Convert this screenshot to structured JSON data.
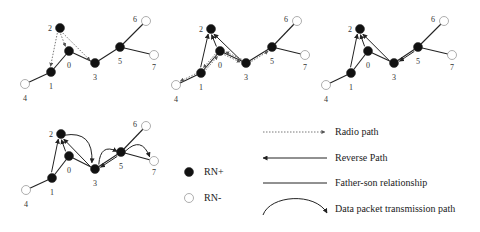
{
  "diagram": {
    "panels": [
      {
        "id": "panel-1",
        "offset": [
          0,
          0
        ],
        "nodes": [
          {
            "id": "0",
            "x": 69,
            "y": 51,
            "type": "RN+",
            "label_pos": [
              69,
              66
            ]
          },
          {
            "id": "1",
            "x": 51,
            "y": 72,
            "type": "RN+",
            "label_pos": [
              51,
              87
            ]
          },
          {
            "id": "2",
            "x": 60,
            "y": 28,
            "type": "RN+",
            "label_pos": [
              50,
              29
            ]
          },
          {
            "id": "3",
            "x": 95,
            "y": 63,
            "type": "RN+",
            "label_pos": [
              95,
              78
            ]
          },
          {
            "id": "4",
            "x": 25,
            "y": 84,
            "type": "RN-",
            "label_pos": [
              25,
              99
            ]
          },
          {
            "id": "5",
            "x": 120,
            "y": 47,
            "type": "RN+",
            "label_pos": [
              120,
              62
            ]
          },
          {
            "id": "6",
            "x": 146,
            "y": 21,
            "type": "RN-",
            "label_pos": [
              135,
              20
            ]
          },
          {
            "id": "7",
            "x": 154,
            "y": 55,
            "type": "RN-",
            "label_pos": [
              154,
              68
            ]
          }
        ],
        "edges": [
          [
            "0",
            "1"
          ],
          [
            "1",
            "4"
          ],
          [
            "0",
            "3"
          ],
          [
            "3",
            "5"
          ],
          [
            "5",
            "6"
          ],
          [
            "5",
            "7"
          ]
        ],
        "radio_paths": [
          [
            "2",
            "1"
          ],
          [
            "2",
            "0"
          ],
          [
            "2",
            "3"
          ]
        ],
        "reverse_paths": [],
        "data_paths": []
      },
      {
        "id": "panel-2",
        "offset": [
          151,
          0
        ],
        "nodes": [
          {
            "id": "0",
            "x": 69,
            "y": 51,
            "type": "RN+",
            "label_pos": [
              69,
              66
            ]
          },
          {
            "id": "1",
            "x": 50,
            "y": 73,
            "type": "RN+",
            "label_pos": [
              50,
              88
            ]
          },
          {
            "id": "2",
            "x": 60,
            "y": 29,
            "type": "RN+",
            "label_pos": [
              50,
              30
            ]
          },
          {
            "id": "3",
            "x": 95,
            "y": 63,
            "type": "RN+",
            "label_pos": [
              95,
              78
            ]
          },
          {
            "id": "4",
            "x": 25,
            "y": 85,
            "type": "RN-",
            "label_pos": [
              25,
              100
            ]
          },
          {
            "id": "5",
            "x": 121,
            "y": 47,
            "type": "RN+",
            "label_pos": [
              121,
              62
            ]
          },
          {
            "id": "6",
            "x": 146,
            "y": 21,
            "type": "RN-",
            "label_pos": [
              135,
              20
            ]
          },
          {
            "id": "7",
            "x": 154,
            "y": 55,
            "type": "RN-",
            "label_pos": [
              154,
              68
            ]
          }
        ],
        "edges": [
          [
            "0",
            "1"
          ],
          [
            "1",
            "4"
          ],
          [
            "0",
            "3"
          ],
          [
            "3",
            "5"
          ],
          [
            "5",
            "6"
          ],
          [
            "5",
            "7"
          ]
        ],
        "radio_paths": [
          [
            "1",
            "4"
          ],
          [
            "0",
            "1"
          ],
          [
            "0",
            "3"
          ],
          [
            "3",
            "0"
          ],
          [
            "3",
            "5"
          ],
          [
            "1",
            "0"
          ]
        ],
        "reverse_paths": [
          [
            "1",
            "2"
          ],
          [
            "0",
            "2"
          ],
          [
            "3",
            "2"
          ]
        ],
        "data_paths": []
      },
      {
        "id": "panel-3",
        "offset": [
          300,
          0
        ],
        "nodes": [
          {
            "id": "0",
            "x": 68,
            "y": 51,
            "type": "RN+",
            "label_pos": [
              68,
              66
            ]
          },
          {
            "id": "1",
            "x": 51,
            "y": 73,
            "type": "RN+",
            "label_pos": [
              51,
              88
            ]
          },
          {
            "id": "2",
            "x": 60,
            "y": 29,
            "type": "RN+",
            "label_pos": [
              50,
              30
            ]
          },
          {
            "id": "3",
            "x": 94,
            "y": 63,
            "type": "RN+",
            "label_pos": [
              94,
              78
            ]
          },
          {
            "id": "4",
            "x": 26,
            "y": 85,
            "type": "RN-",
            "label_pos": [
              26,
              100
            ]
          },
          {
            "id": "5",
            "x": 118,
            "y": 47,
            "type": "RN+",
            "label_pos": [
              118,
              62
            ]
          },
          {
            "id": "6",
            "x": 144,
            "y": 21,
            "type": "RN-",
            "label_pos": [
              133,
              20
            ]
          },
          {
            "id": "7",
            "x": 152,
            "y": 55,
            "type": "RN-",
            "label_pos": [
              152,
              68
            ]
          }
        ],
        "edges": [
          [
            "0",
            "1"
          ],
          [
            "1",
            "4"
          ],
          [
            "0",
            "3"
          ],
          [
            "3",
            "5"
          ],
          [
            "5",
            "6"
          ],
          [
            "5",
            "7"
          ]
        ],
        "radio_paths": [],
        "reverse_paths": [
          [
            "1",
            "2"
          ],
          [
            "0",
            "2"
          ],
          [
            "3",
            "2"
          ],
          [
            "5",
            "3"
          ]
        ],
        "data_paths": []
      },
      {
        "id": "panel-4",
        "offset": [
          0,
          105
        ],
        "nodes": [
          {
            "id": "0",
            "x": 69,
            "y": 51,
            "type": "RN+",
            "label_pos": [
              69,
              66
            ]
          },
          {
            "id": "1",
            "x": 52,
            "y": 73,
            "type": "RN+",
            "label_pos": [
              52,
              88
            ]
          },
          {
            "id": "2",
            "x": 61,
            "y": 29,
            "type": "RN+",
            "label_pos": [
              51,
              30
            ]
          },
          {
            "id": "3",
            "x": 95,
            "y": 64,
            "type": "RN+",
            "label_pos": [
              95,
              79
            ]
          },
          {
            "id": "4",
            "x": 26,
            "y": 85,
            "type": "RN-",
            "label_pos": [
              26,
              100
            ]
          },
          {
            "id": "5",
            "x": 121,
            "y": 47,
            "type": "RN+",
            "label_pos": [
              121,
              62
            ]
          },
          {
            "id": "6",
            "x": 146,
            "y": 21,
            "type": "RN-",
            "label_pos": [
              135,
              20
            ]
          },
          {
            "id": "7",
            "x": 154,
            "y": 56,
            "type": "RN-",
            "label_pos": [
              154,
              68
            ]
          }
        ],
        "edges": [
          [
            "0",
            "1"
          ],
          [
            "1",
            "4"
          ],
          [
            "0",
            "3"
          ],
          [
            "3",
            "5"
          ],
          [
            "5",
            "6"
          ],
          [
            "5",
            "7"
          ]
        ],
        "radio_paths": [],
        "reverse_paths": [
          [
            "1",
            "2"
          ],
          [
            "0",
            "2"
          ],
          [
            "3",
            "2"
          ],
          [
            "5",
            "3"
          ]
        ],
        "data_paths": [
          [
            "2",
            "3"
          ],
          [
            "3",
            "5"
          ],
          [
            "5",
            "7"
          ]
        ]
      }
    ]
  },
  "legend": {
    "node_items": [
      {
        "label": "RN+",
        "type": "filled"
      },
      {
        "label": "RN-",
        "type": "hollow"
      }
    ],
    "line_items": [
      {
        "label": "Radio path",
        "style": "dashed-arrow"
      },
      {
        "label": "Reverse Path",
        "style": "solid-arrow-left"
      },
      {
        "label": "Father-son relationship",
        "style": "solid-line"
      },
      {
        "label": "Data packet transmission path",
        "style": "curved-arrow"
      }
    ]
  },
  "colors": {
    "node_fill_positive": "#111111",
    "node_fill_negative": "#ffffff",
    "node_stroke": "#888888",
    "edge": "#222222",
    "radio": "#555555",
    "text": "#222222"
  }
}
